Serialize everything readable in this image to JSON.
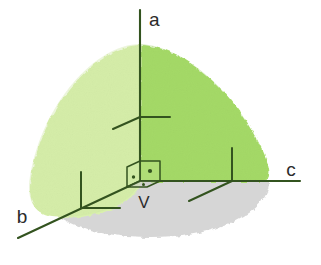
{
  "figure": {
    "width": 321,
    "height": 265,
    "background_color": "#ffffff"
  },
  "labels": {
    "axis_a": "a",
    "axis_b": "b",
    "axis_c": "c",
    "vertex": "V"
  },
  "colors": {
    "surface_light_green": "#d9f0ae",
    "surface_green": "#a8dd6a",
    "ground_gray": "#d2d2d2",
    "line_dark_green": "#33531f",
    "text": "#2b2b2b"
  },
  "geometry": {
    "origin": {
      "x": 140,
      "y": 181
    },
    "axis_a_tip": {
      "x": 140,
      "y": 10
    },
    "axis_b_tip": {
      "x": 18,
      "y": 238
    },
    "axis_c_tip": {
      "x": 300,
      "y": 181
    },
    "octant_apex": {
      "x": 140,
      "y": 44
    },
    "ground_ellipse": {
      "cx": 150,
      "cy": 181,
      "rx": 118,
      "ry": 56
    }
  },
  "markers": {
    "right_angle_at_vertex": {
      "name": "trirectangular-corner-cube",
      "square_count": 3,
      "dot_count": 3
    },
    "tick_on_a": {
      "x": 140,
      "y": 117
    },
    "tick_on_b": {
      "x": 85,
      "y": 211
    },
    "tick_on_c": {
      "x": 232,
      "y": 181
    }
  },
  "icon_names": {
    "axis_a": "axis-a-line",
    "axis_b": "axis-b-line",
    "axis_c": "axis-c-line",
    "octant": "spherical-octant-surface",
    "ground": "ground-plane-ellipse",
    "corner": "right-angle-corner-icon"
  }
}
